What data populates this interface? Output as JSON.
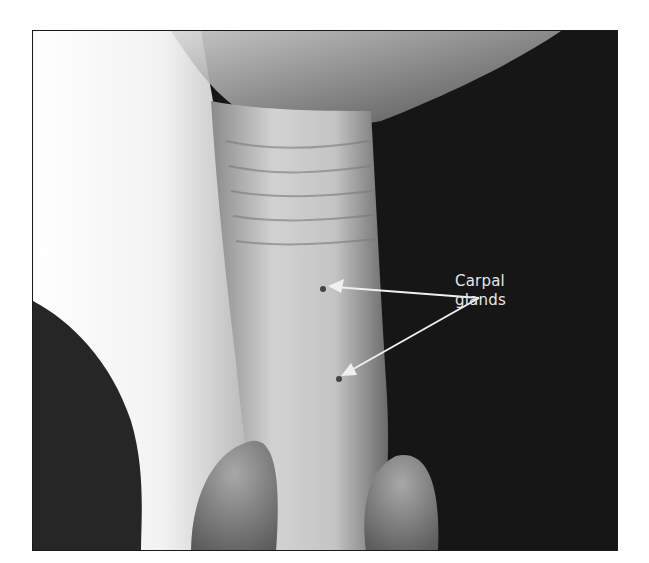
{
  "figure": {
    "label_line1": "Carpal",
    "label_line2": "glands",
    "arrows": [
      {
        "from": [
          478,
          297
        ],
        "to": [
          327,
          285
        ]
      },
      {
        "from": [
          478,
          297
        ],
        "to": [
          340,
          375
        ]
      }
    ],
    "colors": {
      "background": "#141414",
      "leg_highlight": "#f4f4f4",
      "leg_mid": "#bdbdbd",
      "arrow": "#f0f0f0",
      "label": "#e6e6e6"
    }
  }
}
